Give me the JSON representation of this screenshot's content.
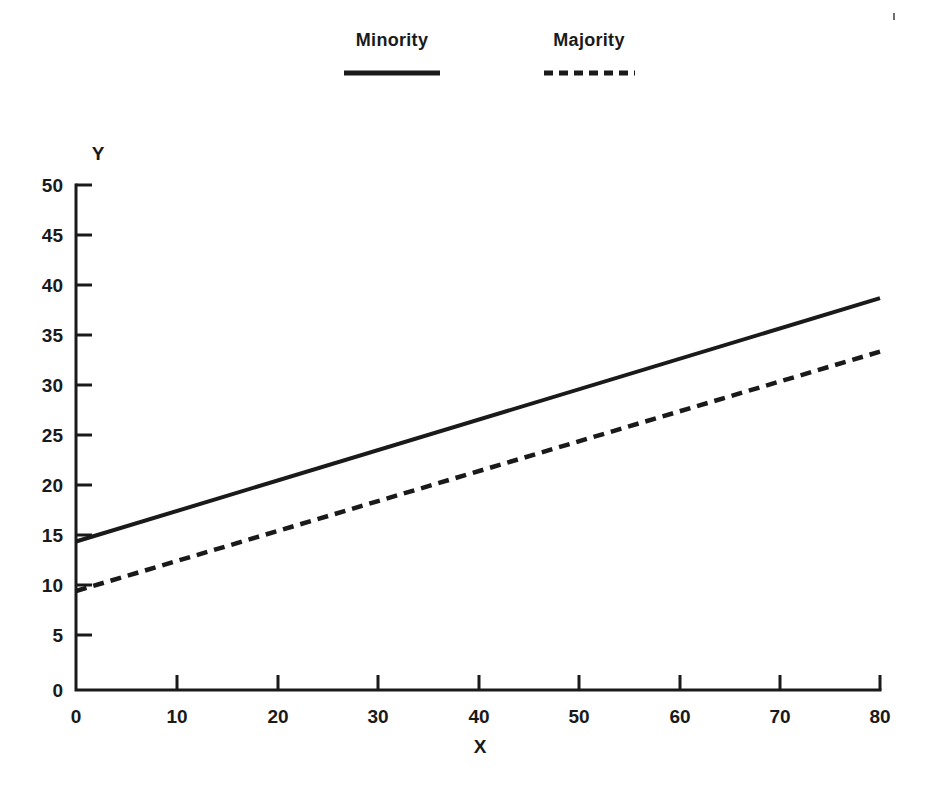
{
  "chart_data": {
    "type": "line",
    "title": "",
    "subtitle": "",
    "xlabel": "X",
    "ylabel": "Y",
    "xlim": [
      0,
      80
    ],
    "ylim": [
      0,
      50
    ],
    "x_ticks": [
      0,
      10,
      20,
      30,
      40,
      50,
      60,
      70,
      80
    ],
    "y_ticks": [
      0,
      5,
      10,
      15,
      20,
      25,
      30,
      35,
      40,
      45,
      50
    ],
    "x_tick_labels": [
      "0",
      "10",
      "20",
      "30",
      "40",
      "50",
      "60",
      "70",
      "80"
    ],
    "y_tick_labels": [
      "0",
      "5",
      "10",
      "15",
      "20",
      "25",
      "30",
      "35",
      "40",
      "45",
      "50"
    ],
    "grid": false,
    "legend_position": "top-center",
    "x": [
      0,
      80
    ],
    "series": [
      {
        "name": "Minority",
        "style": "solid",
        "color": "#1a1a1a",
        "values": [
          14.7,
          38.8
        ]
      },
      {
        "name": "Majority",
        "style": "dashed",
        "color": "#1a1a1a",
        "values": [
          9.8,
          33.5
        ]
      }
    ],
    "legend_entries": [
      "Minority",
      "Majority"
    ],
    "annotations": []
  },
  "legend": {
    "minority_label": "Minority",
    "majority_label": "Majority"
  },
  "axes": {
    "x_title": "X",
    "y_title": "Y"
  },
  "x_tick_labels": {
    "t0": "0",
    "t1": "10",
    "t2": "20",
    "t3": "30",
    "t4": "40",
    "t5": "50",
    "t6": "60",
    "t7": "70",
    "t8": "80"
  },
  "y_tick_labels": {
    "t0": "0",
    "t1": "5",
    "t2": "10",
    "t3": "15",
    "t4": "20",
    "t5": "25",
    "t6": "30",
    "t7": "35",
    "t8": "40",
    "t9": "45",
    "t10": "50"
  },
  "colors": {
    "ink": "#1a1a1a",
    "background": "#ffffff"
  }
}
